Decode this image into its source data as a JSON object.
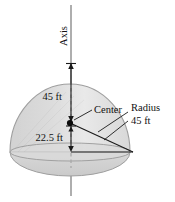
{
  "figure": {
    "title_alt": "Hemispherical dome cross-section diagram",
    "axis_label": "Axis",
    "center_label": "Center",
    "height_label": "45 ft",
    "depth_label": "22.5 ft",
    "radius_label_line1": "Radius",
    "radius_label_line2": "45 ft",
    "colors": {
      "dome_fill": "#dedede",
      "dome_fill_light": "#ececec",
      "dome_stroke": "#9a9a9a",
      "base_fill": "#d2d2d2",
      "line": "#1a1a1a",
      "axis_line": "#8c8c8c",
      "dash_line": "#a8a8a8",
      "text": "#111111"
    },
    "geometry": {
      "center_x": 70,
      "center_y": 123,
      "radius_x": 60,
      "radius_y": 68,
      "base_y": 152,
      "axis_top_y": 5,
      "axis_bottom_y": 196,
      "dome_top_y": 62,
      "base_right_x": 133
    }
  }
}
